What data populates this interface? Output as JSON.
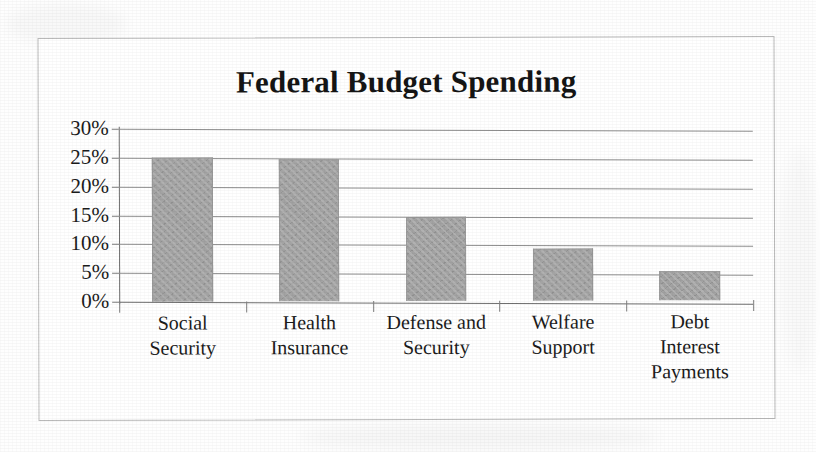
{
  "chart_data": {
    "type": "bar",
    "title": "Federal Budget Spending",
    "xlabel": "",
    "ylabel": "",
    "categories": [
      "Social Security",
      "Health Insurance",
      "Defense and Security",
      "Welfare Support",
      "Debt Interest Payments"
    ],
    "category_lines": [
      [
        "Social",
        "Security"
      ],
      [
        "Health",
        "Insurance"
      ],
      [
        "Defense and",
        "Security"
      ],
      [
        "Welfare",
        "Support"
      ],
      [
        "Debt",
        "Interest",
        "Payments"
      ]
    ],
    "values": [
      25.0,
      24.7,
      14.5,
      9.1,
      5.0
    ],
    "value_unit": "%",
    "ylim": [
      0,
      30
    ],
    "ytick_values": [
      30,
      25,
      20,
      15,
      10,
      5,
      0
    ],
    "ytick_labels": [
      "30%",
      "25%",
      "20%",
      "15%",
      "10%",
      "5%",
      "0%"
    ],
    "grid": true,
    "grid_axis": "y",
    "legend": false,
    "legend_position": "none",
    "bar_color": "#a3a3a3",
    "bar_edge_color": "#9a9a9a",
    "gridline_color": "#8e8e8e",
    "axis_color": "#6f6f6f",
    "text_color": "#1b1b1b",
    "frame_color": "#b9b9b9",
    "background_color": "#ffffff"
  }
}
